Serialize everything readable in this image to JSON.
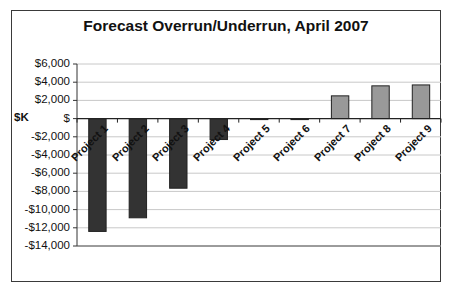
{
  "chart_data": {
    "type": "bar",
    "title": "Forecast Overrun/Underrun, April 2007",
    "xlabel": "",
    "ylabel": "$K",
    "categories": [
      "Project 1",
      "Project 2",
      "Project 3",
      "Project 4",
      "Project 5",
      "Project 6",
      "Project 7",
      "Project 8",
      "Project 9"
    ],
    "values": [
      -12400,
      -10900,
      -7650,
      -2300,
      -100,
      -50,
      2500,
      3600,
      3700
    ],
    "ylim": [
      -14000,
      6000
    ],
    "yticks": [
      6000,
      4000,
      2000,
      0,
      -2000,
      -4000,
      -6000,
      -8000,
      -10000,
      -12000,
      -14000
    ],
    "ytick_labels": [
      "$6,000",
      "$4,000",
      "$2,000",
      "$",
      "-$2,000",
      "-$4,000",
      "-$6,000",
      "-$8,000",
      "-$10,000",
      "-$12,000",
      "-$14,000"
    ],
    "grid": true,
    "legend": null,
    "colors": {
      "negative": "#333333",
      "positive": "#999999",
      "bar_border": "#222222",
      "grid": "#c8c8c8"
    }
  }
}
